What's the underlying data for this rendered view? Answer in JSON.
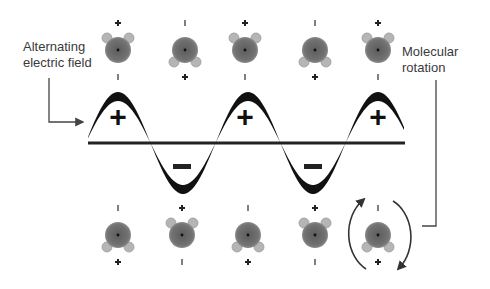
{
  "labels": {
    "alternating_field": "Alternating\nelectric field",
    "molecular_rotation": "Molecular\nrotation"
  },
  "wave": {
    "plus_symbol": "+",
    "minus_symbol": "−",
    "baseline_y": 143,
    "x_start": 88,
    "x_end": 405,
    "peaks_x": [
      118,
      245,
      378
    ],
    "troughs_x": [
      182,
      313
    ],
    "polarity_sequence": [
      "+",
      "-",
      "+",
      "-",
      "+"
    ]
  },
  "molecules": {
    "top_row": [
      {
        "x": 118,
        "hydrogens": "up",
        "sign_above": "+",
        "sign_below": "-"
      },
      {
        "x": 185,
        "hydrogens": "down",
        "sign_above": "-",
        "sign_below": "+"
      },
      {
        "x": 245,
        "hydrogens": "up",
        "sign_above": "+",
        "sign_below": "-"
      },
      {
        "x": 315,
        "hydrogens": "down",
        "sign_above": "-",
        "sign_below": "+"
      },
      {
        "x": 378,
        "hydrogens": "up",
        "sign_above": "+",
        "sign_below": "-"
      }
    ],
    "bottom_row": [
      {
        "x": 118,
        "hydrogens": "down",
        "sign_above": "-",
        "sign_below": "+"
      },
      {
        "x": 182,
        "hydrogens": "up",
        "sign_above": "+",
        "sign_below": "-"
      },
      {
        "x": 248,
        "hydrogens": "down",
        "sign_above": "-",
        "sign_below": "+"
      },
      {
        "x": 315,
        "hydrogens": "up",
        "sign_above": "+",
        "sign_below": "-"
      },
      {
        "x": 378,
        "hydrogens": "down",
        "sign_above": "-",
        "sign_below": "+",
        "rotating": true
      }
    ]
  },
  "colors": {
    "molecule_body": "#6f6f6f",
    "hydrogen": "#b5b5b5",
    "wave": "#111111",
    "text": "#3a3a3a",
    "leader_line": "#444444"
  }
}
